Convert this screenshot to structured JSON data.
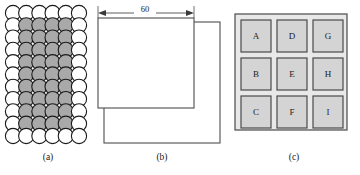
{
  "figure": {
    "background": "#ffffff",
    "ink": "#1a1a1a"
  },
  "panels": [
    {
      "id": "a",
      "caption": "(a)",
      "kind": "circle-packing",
      "columns": 6,
      "rows": 11,
      "edge_fill": "#ffffff",
      "interior_fill": "#a9a9a9",
      "stroke": "#1a1a1a",
      "note": "close-packed circle array, white circles on the outer ring, gray circles in the interior"
    },
    {
      "id": "b",
      "caption": "(b)",
      "kind": "overlapping-rectangles",
      "stroke": "#4d4d4d",
      "fill": "#ffffff",
      "dimensions": [
        {
          "name": "width-dimension",
          "value": "60",
          "orientation": "horizontal"
        },
        {
          "name": "height-dimension",
          "value": "59",
          "orientation": "vertical"
        }
      ]
    },
    {
      "id": "c",
      "caption": "(c)",
      "kind": "lettered-grid",
      "rows": 3,
      "columns": 3,
      "panel_fill": "#e6e6e6",
      "cell_fill": "#d4d4d4",
      "stroke": "#4a4a4a",
      "cells": [
        {
          "label": "A",
          "row": 0,
          "col": 0
        },
        {
          "label": "D",
          "row": 0,
          "col": 1
        },
        {
          "label": "G",
          "row": 0,
          "col": 2
        },
        {
          "label": "B",
          "row": 1,
          "col": 0
        },
        {
          "label": "E",
          "row": 1,
          "col": 1
        },
        {
          "label": "H",
          "row": 1,
          "col": 2
        },
        {
          "label": "C",
          "row": 2,
          "col": 0
        },
        {
          "label": "F",
          "row": 2,
          "col": 1
        },
        {
          "label": "I",
          "row": 2,
          "col": 2
        }
      ]
    }
  ],
  "labels": {
    "caption_a": "(a)",
    "caption_b": "(b)",
    "caption_c": "(c)",
    "dim_60": "60",
    "dim_59": "59",
    "cell_A": "A",
    "cell_B": "B",
    "cell_C": "C",
    "cell_D": "D",
    "cell_E": "E",
    "cell_F": "F",
    "cell_G": "G",
    "cell_H": "H",
    "cell_I": "I"
  }
}
